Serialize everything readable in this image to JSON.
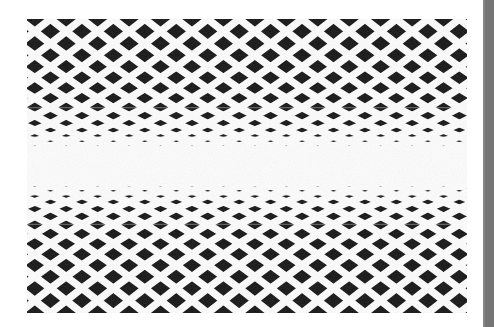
{
  "page": {
    "width": 494,
    "height": 327,
    "background_color": "#ffffff"
  },
  "scanner_bar": {
    "name": "scanner-edge-bar",
    "x": 483,
    "y": 0,
    "width": 11,
    "height": 327,
    "color": "#757575",
    "edge_highlight_color": "#8f8f8f"
  },
  "artwork": {
    "title": "Anamorphic diamond lattice",
    "x": 27,
    "y": 19,
    "width": 440,
    "height": 294,
    "ink_color": "#141414",
    "paper_color": "#fbfbfb",
    "line_color": "#fdfdfd",
    "line_width": 7.5,
    "columns": 7,
    "column_period": 62.9,
    "column_offset": -8,
    "row_nodes": [
      0,
      31,
      60,
      87,
      111,
      131,
      147,
      159,
      168,
      175,
      180,
      184,
      188,
      193,
      200,
      209,
      221,
      237,
      257,
      281,
      308,
      337,
      368
    ],
    "row_node_scale_note": "values are unnormalized y positions spanning the artwork height",
    "vanishing_center_y": 147,
    "grid_stroke_color": "#ffffff",
    "texture_opacity": 0.14
  },
  "chart_data": {
    "type": "heatmap",
    "xlabel": "",
    "ylabel": "",
    "categories": [],
    "values": [],
    "grid": false
  }
}
